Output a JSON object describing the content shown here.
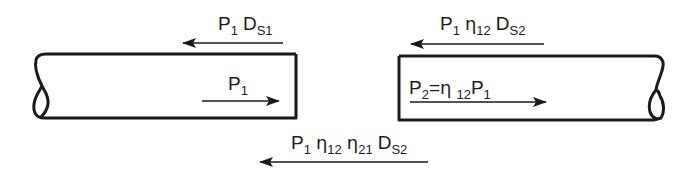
{
  "diagram": {
    "pipes": [
      {
        "name": "pipe-1",
        "inner_label": {
          "symbol": "P",
          "sub": "1"
        }
      },
      {
        "name": "pipe-2",
        "inner_label": {
          "lhs_symbol": "P",
          "lhs_sub": "2",
          "equals": "=",
          "eta": "η",
          "eta_sub": "12",
          "rhs_symbol": "P",
          "rhs_sub": "1"
        }
      }
    ],
    "labels": {
      "top_left": {
        "p": "P",
        "p_sub": "1",
        "d": "D",
        "d_sub": "S1",
        "direction": "left"
      },
      "top_right": {
        "p": "P",
        "p_sub": "1",
        "eta": "η",
        "eta_sub": "12",
        "d": "D",
        "d_sub": "S2",
        "direction": "left"
      },
      "bottom": {
        "p": "P",
        "p_sub": "1",
        "eta1": "η",
        "eta1_sub": "12",
        "eta2": "η",
        "eta2_sub": "21",
        "d": "D",
        "d_sub": "S2",
        "direction": "left"
      },
      "pipe1_flow": {
        "p": "P",
        "p_sub": "1",
        "direction": "right"
      },
      "pipe2_flow": {
        "p2": "P",
        "p2_sub": "2",
        "equals": "=",
        "eta": "η",
        "eta_sub": "12",
        "p1": "P",
        "p1_sub": "1",
        "direction": "right"
      }
    }
  }
}
